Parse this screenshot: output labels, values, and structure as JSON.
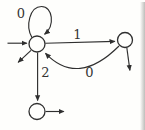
{
  "automaton": {
    "figure_type": "finite-state-automaton-diagram",
    "states": [
      {
        "name": "left-state",
        "position": "upper-left",
        "label": "",
        "is_start": true
      },
      {
        "name": "right-state",
        "position": "upper-right",
        "label": "",
        "is_start": false
      },
      {
        "name": "bottom-state",
        "position": "lower-left",
        "label": "",
        "is_start": false
      }
    ],
    "edges": [
      {
        "from": "left-state",
        "to": "left-state",
        "label": "0",
        "shape": "self-loop-top"
      },
      {
        "from": "left-state",
        "to": "right-state",
        "label": "1",
        "shape": "straight-horizontal"
      },
      {
        "from": "right-state",
        "to": "left-state",
        "label": "0",
        "shape": "curve-below"
      },
      {
        "from": "left-state",
        "to": "bottom-state",
        "label": "2",
        "shape": "straight-vertical"
      }
    ],
    "plain_arrows": [
      {
        "name": "start-arrow",
        "at": "left-state",
        "direction": "right-into-state"
      },
      {
        "name": "exit-arrow-left-state",
        "at": "left-state",
        "direction": "down-left"
      },
      {
        "name": "exit-arrow-right-state",
        "at": "right-state",
        "direction": "down"
      },
      {
        "name": "exit-arrow-bottom-state",
        "at": "bottom-state",
        "direction": "right"
      }
    ],
    "colors": {
      "stroke": "#2f2f2f",
      "label": "#343434",
      "background": "#fefefc"
    }
  }
}
